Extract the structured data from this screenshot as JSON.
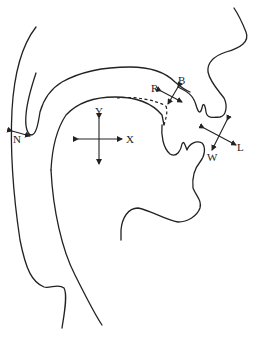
{
  "diagram": {
    "labels": {
      "N": "N",
      "Y": "Y",
      "X": "X",
      "R": "R",
      "B": "B",
      "W": "W",
      "L": "L"
    },
    "line_color": "#222222",
    "background": "#ffffff"
  }
}
